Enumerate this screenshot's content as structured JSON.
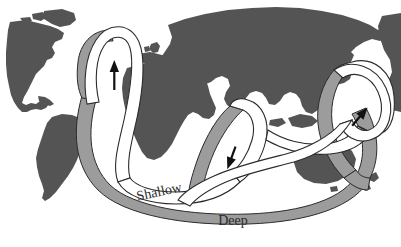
{
  "figure": {
    "type": "diagram",
    "background_color": "#ffffff"
  },
  "colors": {
    "land": "#545454",
    "deep_current": "#9c9c9c",
    "shallow_current": "#ffffff",
    "outline": "#2b2b2b",
    "label": "#2b2b2b",
    "background": "#ffffff"
  },
  "labels": {
    "shallow": "Shallow",
    "deep": "Deep"
  },
  "legend": {
    "shallow_description": "Shallow",
    "deep_description": "Deep"
  },
  "landmasses": [
    {
      "name": "north-america"
    },
    {
      "name": "greenland"
    },
    {
      "name": "south-america"
    },
    {
      "name": "europe"
    },
    {
      "name": "africa"
    },
    {
      "name": "asia"
    },
    {
      "name": "australia"
    },
    {
      "name": "new-zealand"
    },
    {
      "name": "japan"
    },
    {
      "name": "madagascar"
    },
    {
      "name": "british-isles"
    },
    {
      "name": "indonesia"
    }
  ],
  "flow_arrows": [
    {
      "name": "north-atlantic-arrow",
      "direction": "north",
      "ocean": "North Atlantic"
    },
    {
      "name": "indian-ocean-arrow",
      "direction": "southwest",
      "ocean": "Indian Ocean"
    },
    {
      "name": "pacific-ocean-arrow",
      "direction": "west",
      "ocean": "North Pacific"
    }
  ]
}
